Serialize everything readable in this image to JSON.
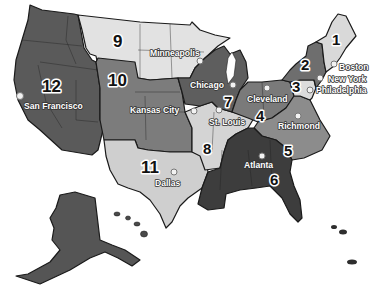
{
  "map": {
    "title": "Federal Reserve Districts",
    "colors": {
      "d1": "#d9d9d9",
      "d2": "#6e6e6e",
      "d3": "#dcdcdc",
      "d4": "#7a7a7a",
      "d5": "#8c8c8c",
      "d6": "#3d3d3d",
      "d7": "#5e5e5e",
      "d8": "#d4d4d4",
      "d9": "#e2e2e2",
      "d10": "#7c7c7c",
      "d11": "#cfcfcf",
      "d12": "#5a5a5a"
    },
    "districts": [
      {
        "number": "1",
        "city": "Boston"
      },
      {
        "number": "2",
        "city": "New York"
      },
      {
        "number": "3",
        "city": "Philadelphia"
      },
      {
        "number": "4",
        "city": "Cleveland"
      },
      {
        "number": "5",
        "city": "Richmond"
      },
      {
        "number": "6",
        "city": "Atlanta"
      },
      {
        "number": "7",
        "city": "Chicago"
      },
      {
        "number": "8",
        "city": "St. Louis"
      },
      {
        "number": "9",
        "city": "Minneapolis"
      },
      {
        "number": "10",
        "city": "Kansas City"
      },
      {
        "number": "11",
        "city": "Dallas"
      },
      {
        "number": "12",
        "city": "San Francisco"
      }
    ]
  }
}
